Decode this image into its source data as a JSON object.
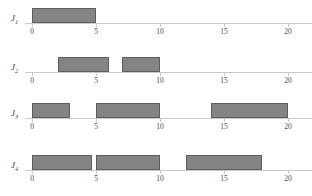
{
  "figure": {
    "type": "gantt",
    "title": "",
    "axis": {
      "label": "",
      "min": 0,
      "max": 22,
      "ticks": [
        0,
        5,
        10,
        15,
        20
      ],
      "tick_labels": [
        "0",
        "5",
        "10",
        "15",
        "20"
      ],
      "arrow": true,
      "color": "#c9c9c9"
    },
    "style": {
      "bar_fill": "#848484",
      "bar_border": "#5e5e5e",
      "text_color": "#3a3a3a",
      "background": "#ffffff"
    },
    "rows": [
      {
        "label": "J",
        "subscript": "1",
        "bars": [
          {
            "start": 0,
            "end": 5
          }
        ]
      },
      {
        "label": "J",
        "subscript": "2",
        "bars": [
          {
            "start": 2,
            "end": 6
          },
          {
            "start": 7,
            "end": 10
          }
        ]
      },
      {
        "label": "J",
        "subscript": "3",
        "bars": [
          {
            "start": 0,
            "end": 3
          },
          {
            "start": 5,
            "end": 10
          },
          {
            "start": 14,
            "end": 20
          }
        ]
      },
      {
        "label": "J",
        "subscript": "4",
        "bars": [
          {
            "start": 0,
            "end": 4.7
          },
          {
            "start": 5,
            "end": 10
          },
          {
            "start": 12,
            "end": 18
          }
        ]
      }
    ]
  },
  "chart_data": {
    "type": "bar",
    "title": "",
    "xlabel": "",
    "ylabel": "",
    "xlim": [
      0,
      22
    ],
    "categories": [
      "J1",
      "J2",
      "J3",
      "J4"
    ],
    "series": [
      {
        "name": "J1",
        "intervals": [
          [
            0,
            5
          ]
        ]
      },
      {
        "name": "J2",
        "intervals": [
          [
            2,
            6
          ],
          [
            7,
            10
          ]
        ]
      },
      {
        "name": "J3",
        "intervals": [
          [
            0,
            3
          ],
          [
            5,
            10
          ],
          [
            14,
            20
          ]
        ]
      },
      {
        "name": "J4",
        "intervals": [
          [
            0,
            4.7
          ],
          [
            5,
            10
          ],
          [
            12,
            18
          ]
        ]
      }
    ],
    "xticks": [
      0,
      5,
      10,
      15,
      20
    ],
    "grid": false,
    "legend": false
  }
}
